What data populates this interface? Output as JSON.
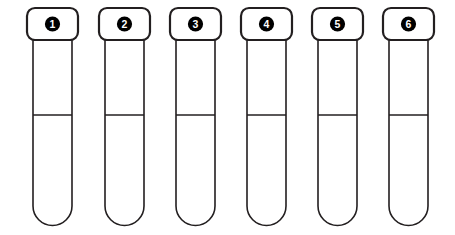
{
  "scene": {
    "title": "Numbered test tube rack",
    "background_color": "#ffffff",
    "width": 455,
    "height": 235,
    "item_count": 6
  },
  "style": {
    "outline_color": "#231f20",
    "cap_fill": "#ffffff",
    "tube_fill": "#ffffff",
    "badge_fill": "#000000",
    "badge_text_color": "#ffffff",
    "fill_line_color": "#231f20",
    "cap_stroke_width": 2.2,
    "tube_stroke_width": 1.6,
    "fill_line_stroke_width": 1.4
  },
  "geometry": {
    "pitch": 71,
    "first_cap_left": 27,
    "cap_width": 51,
    "cap_height": 32,
    "cap_top": 8,
    "cap_corner_radius": 8,
    "body_inset": 6,
    "body_top": 40,
    "body_bottom": 225,
    "body_corner_radius": 19,
    "fill_line_y": 115,
    "badge_radius": 7.6,
    "badge_center_y": 24
  },
  "tubes": [
    {
      "id": "tube-1",
      "label": "1",
      "cap_left": 27
    },
    {
      "id": "tube-2",
      "label": "2",
      "cap_left": 99
    },
    {
      "id": "tube-3",
      "label": "3",
      "cap_left": 170
    },
    {
      "id": "tube-4",
      "label": "4",
      "cap_left": 241
    },
    {
      "id": "tube-5",
      "label": "5",
      "cap_left": 312
    },
    {
      "id": "tube-6",
      "label": "6",
      "cap_left": 383
    }
  ]
}
